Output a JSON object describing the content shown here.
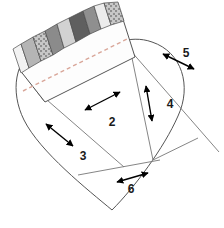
{
  "diagram": {
    "type": "sewing-pattern-diagram",
    "shape": "heart",
    "colors": {
      "outline": "#555555",
      "seam_line": "#777777",
      "stitch_dashed": "#d9a79a",
      "arrow": "#000000",
      "background": "#ffffff",
      "fabric_white": "#f2f2f2",
      "fabric_light_gray": "#cfcfcf",
      "fabric_mid_gray": "#9a9a9a",
      "fabric_dark_gray": "#6e6e6e",
      "fabric_darkest_gray": "#5a5a5a",
      "fabric_check": "#e8e8e8"
    },
    "sections": [
      {
        "id": "sec-2",
        "label": "2",
        "x": 107,
        "y": 122
      },
      {
        "id": "sec-3",
        "label": "3",
        "x": 73,
        "y": 155
      },
      {
        "id": "sec-4",
        "label": "4",
        "x": 165,
        "y": 107
      },
      {
        "id": "sec-5",
        "label": "5",
        "x": 182,
        "y": 55
      },
      {
        "id": "sec-6",
        "label": "6",
        "x": 126,
        "y": 190
      }
    ],
    "arrows": [
      {
        "id": "arrow-2",
        "section": "2",
        "orientation": "diagonal-up-right"
      },
      {
        "id": "arrow-3",
        "section": "3",
        "orientation": "diagonal-down-right"
      },
      {
        "id": "arrow-4",
        "section": "4",
        "orientation": "vertical"
      },
      {
        "id": "arrow-5",
        "section": "5",
        "orientation": "diagonal-down-right"
      },
      {
        "id": "arrow-6",
        "section": "6",
        "orientation": "diagonal-up-right"
      }
    ],
    "fabric_strip": {
      "name": "pieced-fabric-strip",
      "count": 9,
      "pieces": [
        {
          "id": "strip-1",
          "fill": "#f2f2f2",
          "pattern": "solid"
        },
        {
          "id": "strip-2",
          "fill": "#b5b5b5",
          "pattern": "solid"
        },
        {
          "id": "strip-3",
          "fill": "#e8e8e8",
          "pattern": "check"
        },
        {
          "id": "strip-4",
          "fill": "#8b8b8b",
          "pattern": "solid"
        },
        {
          "id": "strip-5",
          "fill": "#d2d2d2",
          "pattern": "solid"
        },
        {
          "id": "strip-6",
          "fill": "#5f5f5f",
          "pattern": "solid"
        },
        {
          "id": "strip-7",
          "fill": "#8f8f8f",
          "pattern": "solid"
        },
        {
          "id": "strip-8",
          "fill": "#ececec",
          "pattern": "solid"
        },
        {
          "id": "strip-9",
          "fill": "#e8e8e8",
          "pattern": "check"
        }
      ]
    },
    "stitch_line": {
      "id": "dashed-stitch-line",
      "style": "dashed"
    }
  }
}
